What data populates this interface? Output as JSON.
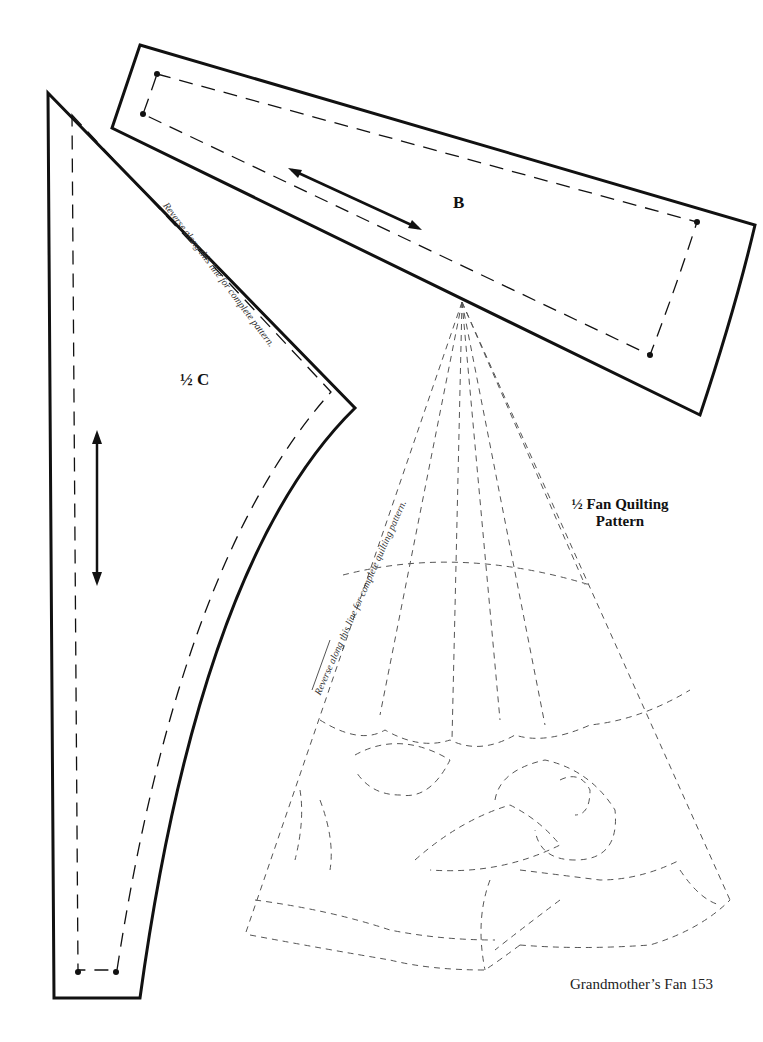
{
  "page": {
    "footer": "Grandmother’s Fan  153"
  },
  "pieces": {
    "b": {
      "label": "B"
    },
    "c": {
      "label": "½ C",
      "reverse_note": "Reverse along this line for complete pattern."
    },
    "fan": {
      "title_line1": "½ Fan Quilting",
      "title_line2": "Pattern",
      "reverse_note": "Reverse along this line for complete quilting pattern."
    }
  },
  "colors": {
    "line": "#111111",
    "quilt_line": "#555555"
  }
}
